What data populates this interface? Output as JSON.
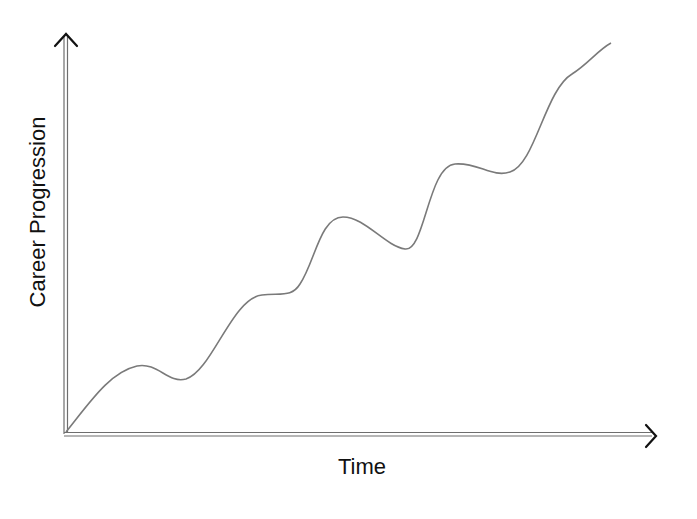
{
  "diagram": {
    "type": "conceptual-line",
    "x_axis": {
      "label": "Time",
      "arrow": "right"
    },
    "y_axis": {
      "label": "Career Progression",
      "arrow": "up"
    },
    "curve": {
      "description": "Wavy upward trend with alternating growth spurts and plateaus/dips",
      "key_points_px": [
        [
          66,
          432
        ],
        [
          137,
          366
        ],
        [
          183,
          380
        ],
        [
          260,
          296
        ],
        [
          295,
          293
        ],
        [
          341,
          217
        ],
        [
          405,
          250
        ],
        [
          455,
          164
        ],
        [
          505,
          174
        ],
        [
          570,
          75
        ],
        [
          611,
          43
        ]
      ]
    },
    "colors": {
      "axis": "#6e6e6e",
      "arrow": "#111111",
      "curve": "#7a7a7a",
      "text": "#111111",
      "background": "#ffffff"
    }
  }
}
